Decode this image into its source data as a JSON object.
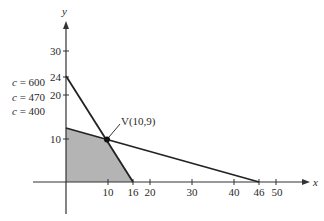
{
  "figure": {
    "type": "linear-programming-feasible-region",
    "axes": {
      "x_label": "x",
      "y_label": "y",
      "x_ticks": [
        "10",
        "16",
        "20",
        "30",
        "40",
        "46",
        "50"
      ],
      "y_ticks": [
        "10",
        "20",
        "24",
        "30"
      ]
    },
    "objective_labels": [
      "c = 600",
      "c = 470",
      "c = 400"
    ],
    "objective_label_parts": [
      {
        "var": "c",
        "eq": " = 600"
      },
      {
        "var": "c",
        "eq": " = 470"
      },
      {
        "var": "c",
        "eq": " = 400"
      }
    ],
    "vertex": {
      "label": "V(10,9)",
      "x": 10,
      "y": 9
    },
    "constraint_lines": [
      {
        "name": "line-1",
        "from": [
          0,
          24
        ],
        "to": [
          16,
          0
        ]
      },
      {
        "name": "line-2",
        "from": [
          0,
          12.4
        ],
        "to": [
          46,
          0
        ]
      }
    ],
    "feasible_region": {
      "vertices": [
        [
          0,
          0
        ],
        [
          0,
          12.4
        ],
        [
          10,
          9
        ],
        [
          16,
          0
        ]
      ],
      "fill": "#b4b4b4"
    },
    "colors": {
      "axis": "#333333",
      "line": "#222222",
      "region": "#b4b4b4",
      "text": "#2a2a2a"
    }
  }
}
